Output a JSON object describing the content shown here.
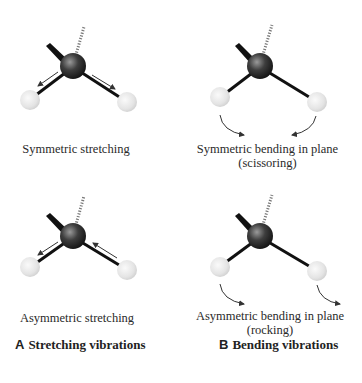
{
  "figure": {
    "panels": [
      {
        "id": "symmetric-stretching",
        "label": "Symmetric stretching",
        "sublabel": ""
      },
      {
        "id": "symmetric-bending",
        "label": "Symmetric bending in plane",
        "sublabel": "(scissoring)"
      },
      {
        "id": "asymmetric-stretching",
        "label": "Asymmetric stretching",
        "sublabel": ""
      },
      {
        "id": "asymmetric-bending",
        "label": "Asymmetric bending in plane",
        "sublabel": "(rocking)"
      }
    ],
    "captions": [
      {
        "letter": "A",
        "text": "Stretching vibrations"
      },
      {
        "letter": "B",
        "text": "Bending vibrations"
      }
    ],
    "colors": {
      "central_atom": "#3a3a3a",
      "hydrogen_atom": "#e6e6e6",
      "bond": "#111111",
      "arrow": "#333333"
    }
  }
}
